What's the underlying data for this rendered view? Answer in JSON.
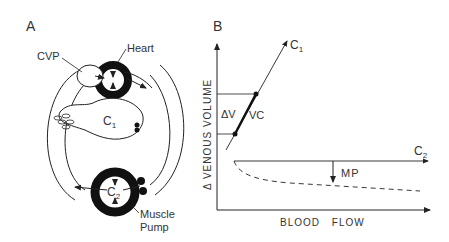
{
  "panel_a": {
    "label": "A",
    "heart_label": "Heart",
    "cvp_label": "CVP",
    "c1_label": "C",
    "c1_sub": "1",
    "c2_label": "C",
    "c2_sub": "2",
    "muscle_label": "Muscle",
    "pump_label": "Pump"
  },
  "panel_b": {
    "label": "B",
    "y_axis_label": "Δ VENOUS VOLUME",
    "x_axis_label": "BLOOD FLOW",
    "c1_label": "C",
    "c1_sub": "1",
    "c2_label": "C",
    "c2_sub": "2",
    "delta_v_label": "ΔV",
    "vc_label": "VC",
    "mp_label": "MP"
  },
  "colors": {
    "ink": "#222222",
    "text": "#333333",
    "background": "#ffffff"
  }
}
